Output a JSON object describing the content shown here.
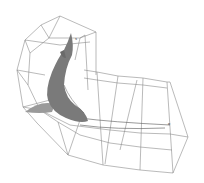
{
  "figure": {
    "labels": {
      "start_marker": "s",
      "end_marker": "e"
    },
    "colors": {
      "background": "#ffffff",
      "lattice": "#8c8c8c",
      "shark_body": "#7a7a7a",
      "shark_shadow": "#9a9a9a",
      "path_curve": "#555555"
    }
  }
}
